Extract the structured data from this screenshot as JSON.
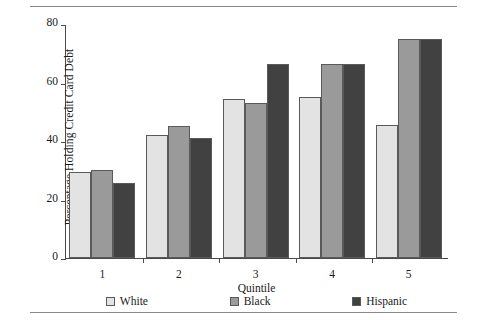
{
  "chart_data": {
    "type": "bar",
    "title": "",
    "xlabel": "Quintile",
    "ylabel": "Percentage Holding Credit Card Debt",
    "categories": [
      "1",
      "2",
      "3",
      "4",
      "5"
    ],
    "series": [
      {
        "name": "White",
        "color": "#e3e3e3",
        "values": [
          29.5,
          42.0,
          54.5,
          55.0,
          45.5
        ]
      },
      {
        "name": "Black",
        "color": "#9a9a9a",
        "values": [
          30.0,
          45.0,
          53.0,
          66.5,
          75.0
        ]
      },
      {
        "name": "Hispanic",
        "color": "#414141",
        "values": [
          25.5,
          41.0,
          66.5,
          66.5,
          75.0
        ]
      }
    ],
    "ylim": [
      0,
      80
    ],
    "yticks": [
      "0",
      "20",
      "40",
      "60",
      "80"
    ],
    "grid": false,
    "legend_position": "bottom"
  }
}
